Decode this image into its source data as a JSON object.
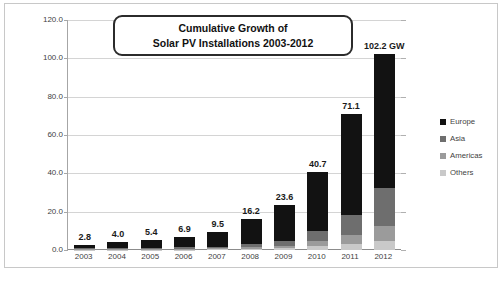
{
  "chart_data": {
    "type": "bar",
    "stacked": true,
    "title": "Cumulative Growth of Solar PV Installations  2003-2012",
    "title_line1": "Cumulative Growth of",
    "title_line2": "Solar PV Installations  2003-2012",
    "xlabel": "",
    "ylabel": "Cumulative Global Installed Capacity (GW)",
    "ylim": [
      0,
      120
    ],
    "yticks": [
      "0.0",
      "20.0",
      "40.0",
      "60.0",
      "80.0",
      "100.0",
      "120.0"
    ],
    "ytick_values": [
      0,
      20,
      40,
      60,
      80,
      100,
      120
    ],
    "grid": true,
    "legend_position": "right",
    "categories": [
      "2003",
      "2004",
      "2005",
      "2006",
      "2007",
      "2008",
      "2009",
      "2010",
      "2011",
      "2012"
    ],
    "totals": [
      2.8,
      4.0,
      5.4,
      6.9,
      9.5,
      16.2,
      23.6,
      40.7,
      71.1,
      102.2
    ],
    "data_labels": [
      "2.8",
      "4.0",
      "5.4",
      "6.9",
      "9.5",
      "16.2",
      "23.6",
      "40.7",
      "71.1",
      "102.2 GW"
    ],
    "peak_label": "102.2 GW",
    "series": [
      {
        "name": "Europe",
        "color": "#121212",
        "values": [
          2.0,
          3.0,
          4.1,
          5.4,
          7.7,
          13.2,
          18.9,
          31.0,
          52.9,
          70.0
        ]
      },
      {
        "name": "Asia",
        "color": "#6e6e6e",
        "values": [
          0.5,
          0.6,
          0.8,
          0.9,
          1.0,
          1.6,
          2.5,
          5.2,
          10.2,
          19.6
        ]
      },
      {
        "name": "Americas",
        "color": "#9b9b9b",
        "values": [
          0.2,
          0.3,
          0.3,
          0.4,
          0.5,
          0.9,
          1.3,
          2.6,
          5.0,
          8.1
        ]
      },
      {
        "name": "Others",
        "color": "#c9c9c9",
        "values": [
          0.1,
          0.1,
          0.2,
          0.2,
          0.3,
          0.5,
          0.9,
          1.9,
          3.0,
          4.5
        ]
      }
    ]
  },
  "legend": {
    "items": [
      {
        "label": "Europe",
        "color": "#121212"
      },
      {
        "label": "Asia",
        "color": "#6e6e6e"
      },
      {
        "label": "Americas",
        "color": "#9b9b9b"
      },
      {
        "label": "Others",
        "color": "#c9c9c9"
      }
    ]
  },
  "caption": {
    "text": ""
  }
}
